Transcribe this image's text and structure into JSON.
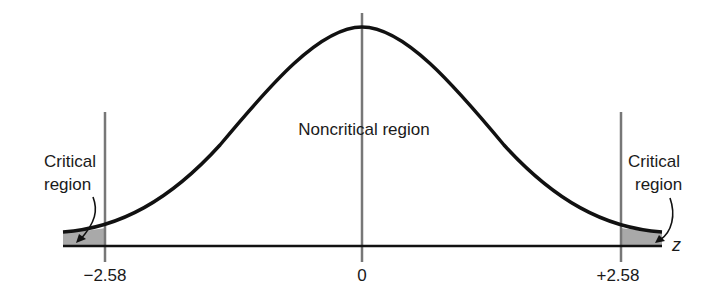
{
  "diagram": {
    "type": "normal-distribution-critical-regions",
    "curve_color": "#111111",
    "line_color": "#777777",
    "shade_color": "#a9a9a9",
    "regions": {
      "left_critical_label_line1": "Critical",
      "left_critical_label_line2": "region",
      "noncritical_label": "Noncritical region",
      "right_critical_label_line1": "Critical",
      "right_critical_label_line2": "region"
    },
    "axis": {
      "variable": "z",
      "ticks": [
        {
          "value": -2.58,
          "label": "−2.58"
        },
        {
          "value": 0,
          "label": "0"
        },
        {
          "value": 2.58,
          "label": "+2.58"
        }
      ]
    },
    "critical_values": [
      -2.58,
      2.58
    ]
  }
}
